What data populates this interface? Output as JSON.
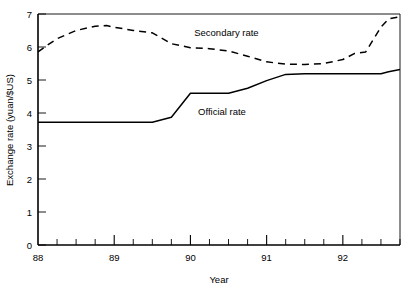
{
  "chart_data": {
    "type": "line",
    "title": "",
    "xlabel": "Year",
    "ylabel": "Exchange rate (yuan/$US)",
    "xlim": [
      88,
      92.75
    ],
    "ylim": [
      0,
      7
    ],
    "ytick_values": [
      0,
      1,
      2,
      3,
      4,
      5,
      6,
      7
    ],
    "ytick_labels": [
      "0",
      "1",
      "2",
      "3",
      "4",
      "5",
      "6",
      "7"
    ],
    "xtick_values": [
      88,
      89,
      90,
      91,
      92
    ],
    "xtick_labels": [
      "88",
      "89",
      "90",
      "91",
      "92"
    ],
    "xminor_step": 0.25,
    "grid": false,
    "legend_position": "inline-annotations",
    "series": [
      {
        "name": "Secondary rate",
        "style": "dashed",
        "label_x": 90.05,
        "label_y": 6.45,
        "x": [
          88.0,
          88.1,
          88.25,
          88.5,
          88.75,
          88.9,
          89.0,
          89.25,
          89.5,
          89.6,
          89.75,
          90.0,
          90.25,
          90.5,
          90.75,
          91.0,
          91.25,
          91.5,
          91.75,
          92.0,
          92.15,
          92.3,
          92.5,
          92.6,
          92.75
        ],
        "y": [
          5.85,
          6.02,
          6.25,
          6.5,
          6.63,
          6.65,
          6.6,
          6.5,
          6.43,
          6.3,
          6.1,
          5.98,
          5.95,
          5.88,
          5.72,
          5.55,
          5.48,
          5.47,
          5.5,
          5.62,
          5.8,
          5.85,
          6.6,
          6.85,
          6.92
        ]
      },
      {
        "name": "Official rate",
        "style": "solid",
        "label_x": 90.1,
        "label_y": 4.05,
        "x": [
          88.0,
          88.5,
          89.0,
          89.5,
          89.75,
          90.0,
          90.25,
          90.5,
          90.75,
          91.0,
          91.25,
          91.5,
          92.0,
          92.5,
          92.6,
          92.75
        ],
        "y": [
          3.72,
          3.72,
          3.72,
          3.72,
          3.87,
          4.6,
          4.6,
          4.6,
          4.75,
          4.98,
          5.17,
          5.19,
          5.19,
          5.19,
          5.25,
          5.32
        ]
      }
    ]
  }
}
